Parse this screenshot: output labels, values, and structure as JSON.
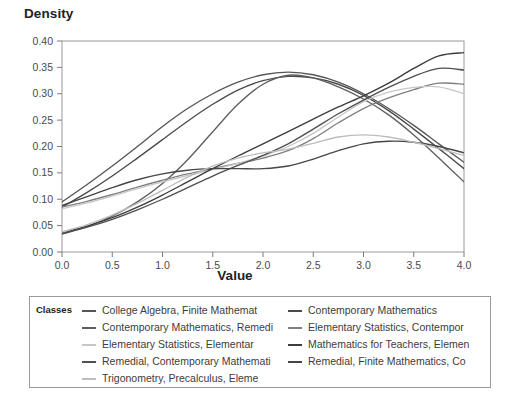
{
  "chart_data": {
    "type": "line",
    "title": "",
    "xlabel": "Value",
    "ylabel": "Density",
    "xlim": [
      0.0,
      4.0
    ],
    "ylim": [
      0.0,
      0.4
    ],
    "xticks": [
      "0.0",
      "0.5",
      "1.0",
      "1.5",
      "2.0",
      "2.5",
      "3.0",
      "3.5",
      "4.0"
    ],
    "yticks": [
      "0.00",
      "0.05",
      "0.10",
      "0.15",
      "0.20",
      "0.25",
      "0.30",
      "0.35",
      "0.40"
    ],
    "grid": false,
    "legend_position": "bottom",
    "legend_title": "Classes",
    "x": [
      0.0,
      0.25,
      0.5,
      0.75,
      1.0,
      1.25,
      1.5,
      1.75,
      2.0,
      2.25,
      2.5,
      2.75,
      3.0,
      3.25,
      3.5,
      3.75,
      4.0
    ],
    "series": [
      {
        "name": "College Algebra, Finite Mathemat",
        "color": "#555555",
        "values": [
          0.095,
          0.128,
          0.163,
          0.2,
          0.238,
          0.272,
          0.3,
          0.322,
          0.336,
          0.341,
          0.336,
          0.322,
          0.3,
          0.272,
          0.24,
          0.205,
          0.17
        ]
      },
      {
        "name": "Contemporary Mathematics",
        "color": "#4a4a4a",
        "values": [
          0.085,
          0.113,
          0.144,
          0.178,
          0.213,
          0.248,
          0.28,
          0.307,
          0.325,
          0.333,
          0.33,
          0.318,
          0.297,
          0.268,
          0.233,
          0.196,
          0.158
        ]
      },
      {
        "name": "Contemporary Mathematics, Remedi",
        "color": "#5e5e5e",
        "values": [
          0.034,
          0.048,
          0.068,
          0.095,
          0.13,
          0.175,
          0.228,
          0.28,
          0.318,
          0.335,
          0.33,
          0.313,
          0.29,
          0.26,
          0.222,
          0.178,
          0.133
        ]
      },
      {
        "name": "Elementary Statistics, Contempor",
        "color": "#808080",
        "values": [
          0.085,
          0.096,
          0.109,
          0.123,
          0.136,
          0.148,
          0.158,
          0.168,
          0.178,
          0.192,
          0.215,
          0.245,
          0.272,
          0.292,
          0.308,
          0.32,
          0.318
        ]
      },
      {
        "name": "Elementary Statistics, Elementar",
        "color": "#c8c8c8",
        "values": [
          0.082,
          0.093,
          0.106,
          0.12,
          0.133,
          0.145,
          0.156,
          0.168,
          0.182,
          0.2,
          0.225,
          0.256,
          0.285,
          0.303,
          0.312,
          0.313,
          0.3
        ]
      },
      {
        "name": "Mathematics for Teachers, Elemen",
        "color": "#3c3c3c",
        "values": [
          0.036,
          0.049,
          0.065,
          0.085,
          0.108,
          0.133,
          0.158,
          0.182,
          0.205,
          0.228,
          0.252,
          0.275,
          0.296,
          0.32,
          0.348,
          0.372,
          0.378
        ]
      },
      {
        "name": "Remedial, Contemporary Mathemati",
        "color": "#4f4f4f",
        "values": [
          0.035,
          0.047,
          0.062,
          0.08,
          0.1,
          0.122,
          0.144,
          0.164,
          0.183,
          0.205,
          0.233,
          0.262,
          0.288,
          0.312,
          0.333,
          0.348,
          0.345
        ]
      },
      {
        "name": "Remedial, Finite Mathematics, Co",
        "color": "#464646",
        "values": [
          0.088,
          0.105,
          0.122,
          0.137,
          0.148,
          0.155,
          0.158,
          0.158,
          0.158,
          0.163,
          0.176,
          0.192,
          0.205,
          0.21,
          0.208,
          0.2,
          0.188
        ]
      },
      {
        "name": "Trigonometry, Precalculus, Eleme",
        "color": "#bdbdbd",
        "values": [
          0.038,
          0.052,
          0.07,
          0.092,
          0.117,
          0.142,
          0.163,
          0.178,
          0.188,
          0.195,
          0.206,
          0.218,
          0.222,
          0.218,
          0.208,
          0.196,
          0.183
        ]
      }
    ]
  },
  "legend": {
    "title": "Classes",
    "left_column": [
      "College Algebra, Finite Mathemat",
      "Contemporary Mathematics, Remedi",
      "Elementary Statistics, Elementar",
      "Remedial, Contemporary Mathemati",
      "Trigonometry, Precalculus, Eleme"
    ],
    "right_column": [
      "Contemporary Mathematics",
      "Elementary Statistics, Contempor",
      "Mathematics for Teachers, Elemen",
      "Remedial, Finite Mathematics, Co"
    ],
    "left_colors": [
      "#555555",
      "#5e5e5e",
      "#c8c8c8",
      "#4f4f4f",
      "#bdbdbd"
    ],
    "right_colors": [
      "#4a4a4a",
      "#808080",
      "#3c3c3c",
      "#464646"
    ]
  },
  "colors": {
    "axis": "#7a7a7a",
    "text": "#3c3c3c",
    "frame": "#9a9a9a"
  }
}
